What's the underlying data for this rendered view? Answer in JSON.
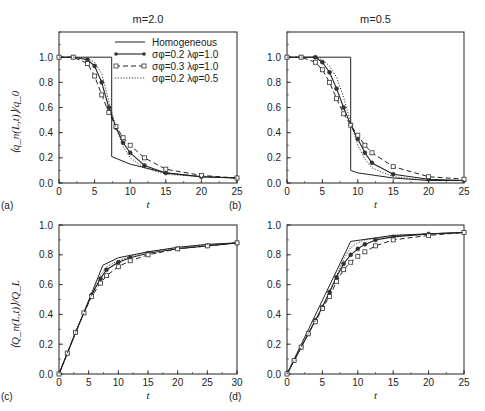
{
  "figure": {
    "legend": [
      {
        "label": "Homogeneous",
        "style": "solid-thin"
      },
      {
        "label": "σφ=0.2  λφ=1.0",
        "style": "solid-circles"
      },
      {
        "label": "σφ=0.3  λφ=1.0",
        "style": "dashed-squares"
      },
      {
        "label": "σφ=0.2  λφ=0.5",
        "style": "dotted"
      }
    ]
  },
  "chart_data": [
    {
      "panel": "(a)",
      "type": "line",
      "title": "m=2.0",
      "xlabel": "t",
      "ylabel": "⟨q_n(L,t)⟩/q_0",
      "xlim": [
        0,
        25
      ],
      "ylim": [
        0,
        1.2
      ],
      "xticks": [
        0,
        5,
        10,
        15,
        20,
        25
      ],
      "yticks": [
        0.0,
        0.2,
        0.4,
        0.6,
        0.8,
        1.0
      ],
      "series": [
        {
          "name": "Homogeneous",
          "x": [
            0,
            7.4,
            7.4,
            10,
            15,
            20,
            25
          ],
          "y": [
            1.0,
            1.0,
            0.21,
            0.15,
            0.08,
            0.05,
            0.04
          ]
        },
        {
          "name": "σφ=0.2 λφ=1.0",
          "x": [
            0,
            2,
            4,
            5,
            6,
            7,
            8,
            9,
            10,
            12,
            15,
            20,
            25
          ],
          "y": [
            1.0,
            1.0,
            0.98,
            0.93,
            0.8,
            0.6,
            0.44,
            0.32,
            0.24,
            0.14,
            0.08,
            0.05,
            0.04
          ]
        },
        {
          "name": "σφ=0.3 λφ=1.0",
          "x": [
            0,
            2,
            4,
            5,
            6,
            7,
            8,
            9,
            10,
            12,
            15,
            20,
            25
          ],
          "y": [
            1.0,
            1.0,
            0.95,
            0.85,
            0.7,
            0.56,
            0.45,
            0.36,
            0.3,
            0.2,
            0.11,
            0.06,
            0.04
          ]
        },
        {
          "name": "σφ=0.2 λφ=0.5",
          "x": [
            0,
            2,
            4,
            5,
            6,
            7,
            8,
            9,
            10,
            12,
            15,
            20,
            25
          ],
          "y": [
            1.0,
            1.0,
            0.99,
            0.96,
            0.87,
            0.65,
            0.44,
            0.29,
            0.2,
            0.12,
            0.07,
            0.05,
            0.04
          ]
        }
      ]
    },
    {
      "panel": "(b)",
      "type": "line",
      "title": "m=0.5",
      "xlabel": "t",
      "ylabel": "",
      "xlim": [
        0,
        25
      ],
      "ylim": [
        0,
        1.2
      ],
      "xticks": [
        0,
        5,
        10,
        15,
        20,
        25
      ],
      "yticks": [
        0.0,
        0.2,
        0.4,
        0.6,
        0.8,
        1.0
      ],
      "series": [
        {
          "name": "Homogeneous",
          "x": [
            0,
            9,
            9,
            10,
            15,
            20,
            25
          ],
          "y": [
            1.0,
            1.0,
            0.1,
            0.08,
            0.04,
            0.02,
            0.02
          ]
        },
        {
          "name": "σφ=0.2 λφ=1.0",
          "x": [
            0,
            2,
            4,
            5,
            6,
            7,
            8,
            9,
            10,
            11,
            12,
            15,
            20,
            25
          ],
          "y": [
            1.0,
            1.0,
            1.0,
            0.96,
            0.88,
            0.75,
            0.6,
            0.46,
            0.35,
            0.24,
            0.16,
            0.07,
            0.03,
            0.02
          ]
        },
        {
          "name": "σφ=0.3 λφ=1.0",
          "x": [
            0,
            2,
            4,
            5,
            6,
            7,
            8,
            9,
            10,
            11,
            12,
            15,
            20,
            25
          ],
          "y": [
            1.0,
            1.0,
            0.96,
            0.9,
            0.8,
            0.67,
            0.55,
            0.46,
            0.38,
            0.3,
            0.24,
            0.13,
            0.05,
            0.03
          ]
        },
        {
          "name": "σφ=0.2 λφ=0.5",
          "x": [
            0,
            2,
            4,
            5,
            6,
            7,
            8,
            9,
            10,
            11,
            12,
            15,
            20,
            25
          ],
          "y": [
            1.0,
            1.0,
            1.0,
            0.98,
            0.93,
            0.84,
            0.68,
            0.48,
            0.3,
            0.19,
            0.12,
            0.05,
            0.02,
            0.02
          ]
        }
      ]
    },
    {
      "panel": "(c)",
      "type": "line",
      "title": "",
      "xlabel": "t",
      "ylabel": "⟨Q_n(L,t)⟩/Q_L",
      "xlim": [
        0,
        30
      ],
      "ylim": [
        0,
        1.0
      ],
      "xticks": [
        0,
        5,
        10,
        15,
        20,
        25,
        30
      ],
      "yticks": [
        0.0,
        0.2,
        0.4,
        0.6,
        0.8,
        1.0
      ],
      "series": [
        {
          "name": "Homogeneous",
          "x": [
            0,
            7.4,
            10,
            15,
            20,
            25,
            30
          ],
          "y": [
            0,
            0.73,
            0.78,
            0.82,
            0.85,
            0.87,
            0.88
          ]
        },
        {
          "name": "σφ=0.2 λφ=1.0",
          "x": [
            0,
            1.4,
            2.8,
            4.2,
            5.5,
            7,
            8,
            10,
            12,
            15,
            20,
            25,
            30
          ],
          "y": [
            0,
            0.14,
            0.28,
            0.41,
            0.53,
            0.64,
            0.7,
            0.75,
            0.78,
            0.81,
            0.84,
            0.86,
            0.88
          ]
        },
        {
          "name": "σφ=0.3 λφ=1.0",
          "x": [
            0,
            1.4,
            2.8,
            4.2,
            5.5,
            7,
            8,
            10,
            12,
            15,
            20,
            25,
            30
          ],
          "y": [
            0,
            0.14,
            0.28,
            0.41,
            0.52,
            0.61,
            0.66,
            0.72,
            0.76,
            0.8,
            0.84,
            0.86,
            0.88
          ]
        },
        {
          "name": "σφ=0.2 λφ=0.5",
          "x": [
            0,
            1.4,
            2.8,
            4.2,
            5.5,
            7,
            8,
            10,
            12,
            15,
            20,
            25,
            30
          ],
          "y": [
            0,
            0.14,
            0.28,
            0.41,
            0.53,
            0.66,
            0.72,
            0.76,
            0.79,
            0.82,
            0.85,
            0.87,
            0.88
          ]
        }
      ]
    },
    {
      "panel": "(d)",
      "type": "line",
      "title": "",
      "xlabel": "t",
      "ylabel": "",
      "xlim": [
        0,
        25
      ],
      "ylim": [
        0,
        1.0
      ],
      "xticks": [
        0,
        5,
        10,
        15,
        20,
        25
      ],
      "yticks": [
        0.0,
        0.2,
        0.4,
        0.6,
        0.8,
        1.0
      ],
      "series": [
        {
          "name": "Homogeneous",
          "x": [
            0,
            9,
            12,
            15,
            20,
            25
          ],
          "y": [
            0,
            0.89,
            0.91,
            0.93,
            0.94,
            0.95
          ]
        },
        {
          "name": "σφ=0.2 λφ=1.0",
          "x": [
            0,
            1,
            2,
            3,
            4,
            5,
            6,
            7,
            8,
            9,
            10,
            11,
            12.5,
            15,
            20,
            25
          ],
          "y": [
            0,
            0.09,
            0.18,
            0.27,
            0.36,
            0.45,
            0.55,
            0.65,
            0.74,
            0.8,
            0.84,
            0.87,
            0.9,
            0.92,
            0.94,
            0.95
          ]
        },
        {
          "name": "σφ=0.3 λφ=1.0",
          "x": [
            0,
            1,
            2,
            3,
            4,
            5,
            6,
            7,
            8,
            9,
            10,
            11,
            12.5,
            15,
            20,
            25
          ],
          "y": [
            0,
            0.09,
            0.18,
            0.27,
            0.35,
            0.44,
            0.52,
            0.62,
            0.7,
            0.75,
            0.79,
            0.82,
            0.86,
            0.9,
            0.93,
            0.95
          ]
        },
        {
          "name": "σφ=0.2 λφ=0.5",
          "x": [
            0,
            1,
            2,
            3,
            4,
            5,
            6,
            7,
            8,
            9,
            10,
            11,
            12.5,
            15,
            20,
            25
          ],
          "y": [
            0,
            0.09,
            0.18,
            0.27,
            0.36,
            0.45,
            0.55,
            0.66,
            0.77,
            0.85,
            0.88,
            0.9,
            0.91,
            0.93,
            0.94,
            0.95
          ]
        }
      ]
    }
  ]
}
